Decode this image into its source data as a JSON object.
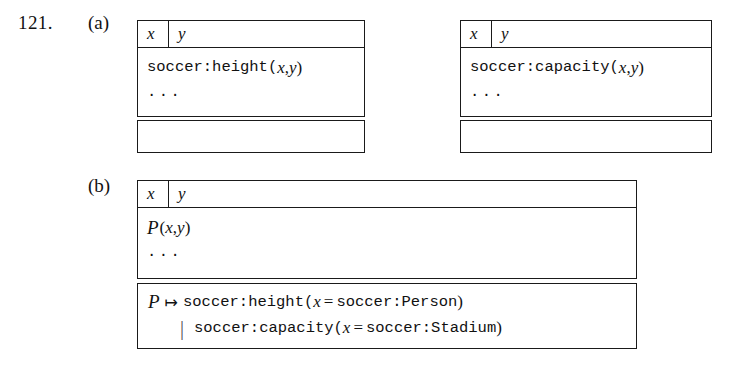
{
  "figure": {
    "number": "121.",
    "sub_labels": {
      "a": "(a)",
      "b": "(b)"
    }
  },
  "columns": {
    "x": "x",
    "y": "y"
  },
  "ellipsis": "...",
  "panel_a": {
    "tables": [
      {
        "name": "height-relation",
        "header": [
          "x",
          "y"
        ],
        "rows": [
          "soccer:height(x, y)",
          "..."
        ],
        "atom": {
          "prefix": "soccer:height(",
          "arg1": "x",
          "comma": ", ",
          "arg2": "y",
          "suffix": ")"
        },
        "footer": ""
      },
      {
        "name": "capacity-relation",
        "header": [
          "x",
          "y"
        ],
        "rows": [
          "soccer:capacity(x, y)",
          "..."
        ],
        "atom": {
          "prefix": "soccer:capacity(",
          "arg1": "x",
          "comma": ", ",
          "arg2": "y",
          "suffix": ")"
        },
        "footer": ""
      }
    ]
  },
  "panel_b": {
    "table": {
      "name": "predicate-variable-relation",
      "header": [
        "x",
        "y"
      ],
      "rows": [
        "P(x, y)",
        "..."
      ],
      "atom": {
        "pred": "P",
        "open": "(",
        "arg1": "x",
        "comma": ", ",
        "arg2": "y",
        "close": ")"
      },
      "rule": {
        "lhs": "P",
        "mapsto": "↦",
        "line1": {
          "functor": "soccer:height(",
          "var": "x",
          "eq": "=",
          "value": "soccer:Person",
          "close": ")"
        },
        "alt_bar": "|",
        "line2": {
          "functor": "soccer:capacity(",
          "var": "x",
          "eq": "=",
          "value": "soccer:Stadium",
          "close": ")"
        }
      }
    }
  }
}
